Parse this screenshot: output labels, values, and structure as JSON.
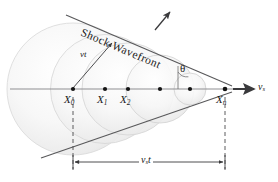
{
  "figure": {
    "kind": "physics-diagram",
    "wavefront_label": "Shock Wavefront",
    "radius_label": "vt",
    "angle_label": "θ",
    "source_speed_label": "v",
    "source_speed_sub": "s",
    "distance_label": "v",
    "distance_sub": "s",
    "distance_label_tail": "t",
    "points": [
      {
        "base": "X",
        "sub": "0",
        "x": 73,
        "label_x": 64,
        "label_y": 93
      },
      {
        "base": "X",
        "sub": "1",
        "x": 105,
        "label_x": 96,
        "label_y": 93
      },
      {
        "base": "X",
        "sub": "2",
        "x": 128,
        "label_x": 119,
        "label_y": 93
      },
      {
        "base": "",
        "sub": "",
        "x": 160,
        "label_x": 0,
        "label_y": 0
      },
      {
        "base": "",
        "sub": "",
        "x": 190,
        "label_x": 0,
        "label_y": 0
      },
      {
        "base": "X",
        "sub": "n",
        "x": 225,
        "label_x": 215,
        "label_y": 93
      }
    ],
    "colors": {
      "line": "#58585a",
      "axis": "#8a8a8d",
      "wave_fill_light": "#f4f4f4",
      "wave_fill_mid": "#e6e6e6",
      "wave_stroke": "#d2d2d2",
      "dot": "#141414",
      "text": "#1a1a1a"
    },
    "geometry": {
      "axis_y": 89,
      "axis_x0": 10,
      "axis_x1": 240,
      "apex_x": 225,
      "apex_y": 89,
      "half_angle_deg": 20,
      "dim_line_y": 162,
      "dash_left_x": 73,
      "dash_right_x": 225
    }
  }
}
